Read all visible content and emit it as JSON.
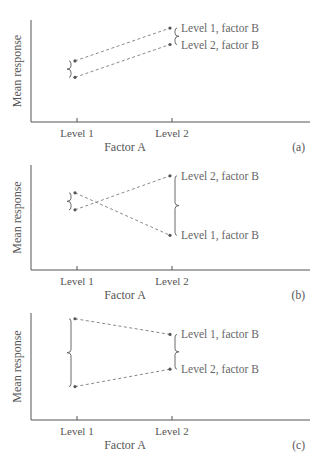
{
  "chart_data": [
    {
      "type": "line",
      "panel_label": "(a)",
      "xlabel": "Factor A",
      "ylabel": "Mean response",
      "categories": [
        "Level 1",
        "Level 2"
      ],
      "series": [
        {
          "name": "Level 1, factor B",
          "values": [
            0.55,
            0.95
          ]
        },
        {
          "name": "Level 2, factor B",
          "values": [
            0.35,
            0.75
          ]
        }
      ],
      "ylim": [
        0,
        1
      ],
      "grid": false,
      "description": "No interaction: parallel lines"
    },
    {
      "type": "line",
      "panel_label": "(b)",
      "xlabel": "Factor A",
      "ylabel": "Mean response",
      "categories": [
        "Level 1",
        "Level 2"
      ],
      "series": [
        {
          "name": "Level 1, factor B",
          "values": [
            0.72,
            0.22
          ]
        },
        {
          "name": "Level 2, factor B",
          "values": [
            0.52,
            0.92
          ]
        }
      ],
      "ylim": [
        0,
        1
      ],
      "grid": false,
      "description": "Crossing interaction"
    },
    {
      "type": "line",
      "panel_label": "(c)",
      "xlabel": "Factor A",
      "ylabel": "Mean response",
      "categories": [
        "Level 1",
        "Level 2"
      ],
      "series": [
        {
          "name": "Level 1, factor B",
          "values": [
            0.98,
            0.8
          ]
        },
        {
          "name": "Level 2, factor B",
          "values": [
            0.2,
            0.4
          ]
        }
      ],
      "ylim": [
        0,
        1
      ],
      "grid": false,
      "description": "Converging interaction"
    }
  ]
}
